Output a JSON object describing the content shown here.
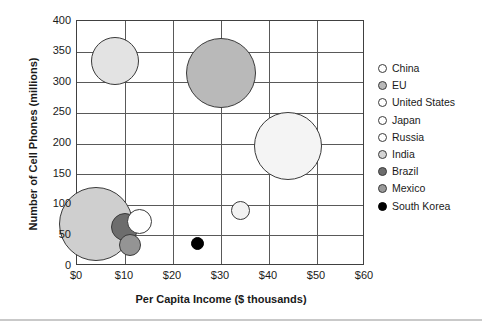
{
  "chart_data": {
    "type": "scatter",
    "title": "",
    "xlabel": "Per Capita Income ($ thousands)",
    "ylabel": "Number of Cell Phones (millions)",
    "xlim": [
      0,
      60
    ],
    "ylim": [
      0,
      400
    ],
    "xticks": [
      "$0",
      "$10",
      "$20",
      "$30",
      "$40",
      "$50",
      "$60"
    ],
    "xtick_values": [
      0,
      10,
      20,
      30,
      40,
      50,
      60
    ],
    "yticks": [
      "0",
      "50",
      "100",
      "150",
      "200",
      "250",
      "300",
      "350",
      "400"
    ],
    "ytick_values": [
      0,
      50,
      100,
      150,
      200,
      250,
      300,
      350,
      400
    ],
    "grid": true,
    "legend_position": "right",
    "bubble_size_meaning": "population",
    "points": [
      {
        "name": "China",
        "x": 8,
        "y": 335,
        "r_px": 24.0,
        "color": "#e3e3e3"
      },
      {
        "name": "EU",
        "x": 30,
        "y": 315,
        "r_px": 35.0,
        "color": "#b9b9b9"
      },
      {
        "name": "United States",
        "x": 44,
        "y": 196,
        "r_px": 34.0,
        "color": "#f4f4f4"
      },
      {
        "name": "Japan",
        "x": 34,
        "y": 90,
        "r_px": 9.5,
        "color": "#f2f2f2"
      },
      {
        "name": "Russia",
        "x": 13,
        "y": 72,
        "r_px": 12.5,
        "color": "#ffffff"
      },
      {
        "name": "India",
        "x": 4,
        "y": 68,
        "r_px": 37.0,
        "color": "#cfcfcf"
      },
      {
        "name": "Brazil",
        "x": 10,
        "y": 64,
        "r_px": 14.0,
        "color": "#6d6d6d"
      },
      {
        "name": "Mexico",
        "x": 11,
        "y": 34,
        "r_px": 11.0,
        "color": "#949494"
      },
      {
        "name": "South Korea",
        "x": 25,
        "y": 37,
        "r_px": 6.5,
        "color": "#000000"
      }
    ]
  },
  "legend": {
    "items": [
      {
        "label": "China",
        "color": "#ffffff"
      },
      {
        "label": "EU",
        "color": "#b9b9b9"
      },
      {
        "label": "United States",
        "color": "#ffffff"
      },
      {
        "label": "Japan",
        "color": "#ffffff"
      },
      {
        "label": "Russia",
        "color": "#ffffff"
      },
      {
        "label": "India",
        "color": "#d4d4d4"
      },
      {
        "label": "Brazil",
        "color": "#6d6d6d"
      },
      {
        "label": "Mexico",
        "color": "#9a9a9a"
      },
      {
        "label": "South Korea",
        "color": "#000000"
      }
    ]
  }
}
